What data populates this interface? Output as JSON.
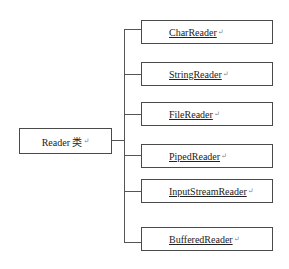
{
  "diagram": {
    "type": "tree",
    "root": {
      "label": "Reader 类",
      "mark": "↵"
    },
    "children": [
      {
        "label": "CharReader",
        "mark": "↵"
      },
      {
        "label": "StringReader",
        "mark": "↵"
      },
      {
        "label": "FileReader",
        "mark": "↵"
      },
      {
        "label": "PipedReader",
        "mark": "↵"
      },
      {
        "label": "InputStreamReader",
        "mark": "↵"
      },
      {
        "label": "BufferedReader",
        "mark": "↵"
      }
    ],
    "colors": {
      "border": "#4a4a4a",
      "line": "#555555",
      "text": "#222222",
      "background": "#ffffff"
    }
  }
}
